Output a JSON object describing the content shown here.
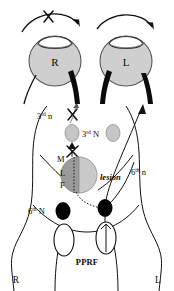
{
  "figure": {
    "colors": {
      "ink": "#0a0a0a",
      "globe_fill": "#cfcfcf",
      "globe_stroke": "#555555",
      "nucleus_fill": "#c6c6c6",
      "lesion_dark": "#9a9a9a",
      "lesion_light": "#c9c9c9",
      "black_nucleus": "#000000",
      "background": "#ffffff"
    }
  },
  "eyes": {
    "right": {
      "label": "R",
      "gaze_arrow_blocked": true,
      "block_marker": "x-mark"
    },
    "left": {
      "label": "L",
      "gaze_arrow_blocked": false,
      "block_marker": ""
    }
  },
  "labels": {
    "third_nerve": {
      "ordinal": "3",
      "sup": "rd",
      "text": " n"
    },
    "third_nucleus": {
      "ordinal": "3",
      "sup": "rd",
      "text": " N"
    },
    "sixth_nucleus": {
      "ordinal": "6",
      "sup": "th",
      "text": " N"
    },
    "sixth_nerve": {
      "ordinal": "6",
      "sup": "th",
      "text": " n"
    },
    "mlf_m": "M",
    "mlf_l": "L",
    "mlf_f": "F",
    "lesion": "lesion",
    "pprf": "PPRF",
    "side_right": "R",
    "side_left": "L"
  },
  "markers": {
    "lesion_block_x": "x-mark",
    "third_nerve_block_x": "x-mark",
    "gaze_block_x": "x-mark"
  }
}
